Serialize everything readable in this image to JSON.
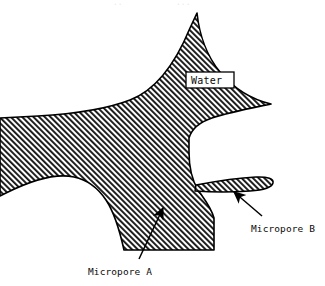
{
  "figure": {
    "background_color": "#ffffff",
    "ink_color": "#000000",
    "hatch_color": "#111111",
    "hatch_angle_label": "45-degree-rising",
    "solid_region_name": "water"
  },
  "labels": {
    "water": "Water",
    "micropore_a": "Micropore A",
    "micropore_b": "Micropore B"
  },
  "callouts": [
    {
      "id": "micropore-a",
      "label": "Micropore A",
      "label_x": 88,
      "label_y": 272,
      "arrow_tail_x": 139,
      "arrow_tail_y": 259,
      "arrow_head_x": 163,
      "arrow_head_y": 208
    },
    {
      "id": "micropore-b",
      "label": "Micropore B",
      "label_x": 251,
      "label_y": 229,
      "arrow_tail_x": 262,
      "arrow_tail_y": 216,
      "arrow_head_x": 233,
      "arrow_head_y": 192
    }
  ],
  "water_box": {
    "x": 186,
    "y": 72,
    "width": 48,
    "height": 16,
    "fill": "#ffffff",
    "stroke": "#000000"
  },
  "top_fragments": {
    "left": "..",
    "right": "..."
  }
}
